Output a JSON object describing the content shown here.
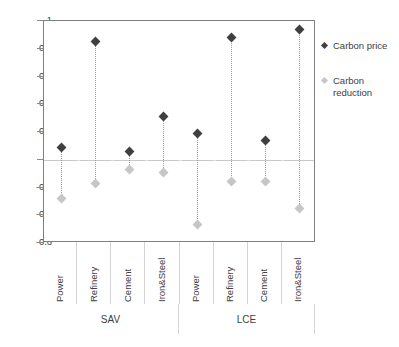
{
  "chart_data": {
    "type": "scatter",
    "title": "",
    "subtitle": "",
    "xlabel": "",
    "ylabel": "",
    "ylim": [
      -0.6,
      1.0
    ],
    "yticks": [
      1,
      0.8,
      0.6,
      0.4,
      0.2,
      0,
      -0.2,
      -0.4,
      -0.6
    ],
    "ytick_labels": [
      "1",
      "0.8",
      "0.6",
      "0.4",
      "0.2",
      "0",
      "-0.2",
      "-0.4",
      "-0.6"
    ],
    "grid": false,
    "zero_line": true,
    "legend_position": "right",
    "categories": [
      "Power",
      "Refinery",
      "Cement",
      "Iron&Steel",
      "Power",
      "Refinery",
      "Cement",
      "Iron&Steel"
    ],
    "groups": [
      {
        "label": "SAV",
        "span": 4
      },
      {
        "label": "LCE",
        "span": 4
      }
    ],
    "series": [
      {
        "name": "Carbon price",
        "color": "#3f3f3f",
        "marker": "diamond",
        "values": [
          0.09,
          0.85,
          0.06,
          0.31,
          0.19,
          0.88,
          0.14,
          0.94
        ]
      },
      {
        "name": "Carbon reduction",
        "color": "#c6c6c6",
        "marker": "diamond",
        "values": [
          -0.28,
          -0.17,
          -0.07,
          -0.09,
          -0.47,
          -0.16,
          -0.16,
          -0.35
        ]
      }
    ],
    "connector_style": "dotted",
    "connector_color": "#9b9b9b"
  },
  "legend": {
    "items": [
      {
        "label": "Carbon price",
        "label_line1": "Carbon price",
        "label_line2": ""
      },
      {
        "label": "Carbon reduction",
        "label_line1": "Carbon",
        "label_line2": "reduction"
      }
    ]
  },
  "axis": {
    "y_labels": [
      "1",
      "0.8",
      "0.6",
      "0.4",
      "0.2",
      "0",
      "-0.2",
      "-0.4",
      "-0.6"
    ],
    "category_labels": [
      "Power",
      "Refinery",
      "Cement",
      "Iron&Steel",
      "Power",
      "Refinery",
      "Cement",
      "Iron&Steel"
    ],
    "group_labels": [
      "SAV",
      "LCE"
    ]
  },
  "colors": {
    "carbon_price": "#3f3f3f",
    "carbon_reduction": "#c6c6c6",
    "axis": "#808080",
    "zero_line": "#c9c9c9",
    "separator": "#d4d4d4",
    "text": "#404040"
  }
}
